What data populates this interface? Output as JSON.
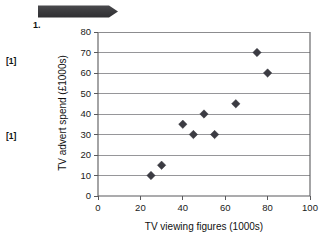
{
  "page": {
    "question_number": "1.",
    "banner": "redaction-bar",
    "background_color": "#ffffff"
  },
  "margin_marks": [
    {
      "label": "[1]"
    },
    {
      "label": "[1]"
    }
  ],
  "chart_data": {
    "type": "scatter",
    "title": "",
    "xlabel": "TV viewing figures (1000s)",
    "ylabel": "TV advert spend (£1000s)",
    "xlim": [
      0,
      100
    ],
    "ylim": [
      0,
      80
    ],
    "xticks": [
      0,
      20,
      40,
      60,
      80,
      100
    ],
    "yticks": [
      0,
      10,
      20,
      30,
      40,
      50,
      60,
      70,
      80
    ],
    "xtick_labels": [
      "0",
      "20",
      "40",
      "60",
      "80",
      "100"
    ],
    "ytick_labels": [
      "0",
      "10",
      "20",
      "30",
      "40",
      "50",
      "60",
      "70",
      "80"
    ],
    "grid": "horizontal",
    "legend": "none",
    "marker_shape": "diamond",
    "marker_color": "#3b3b42",
    "points": [
      {
        "x": 25,
        "y": 10
      },
      {
        "x": 30,
        "y": 15
      },
      {
        "x": 40,
        "y": 35
      },
      {
        "x": 45,
        "y": 30
      },
      {
        "x": 50,
        "y": 40
      },
      {
        "x": 55,
        "y": 30
      },
      {
        "x": 65,
        "y": 45
      },
      {
        "x": 75,
        "y": 70
      },
      {
        "x": 80,
        "y": 60
      }
    ]
  }
}
